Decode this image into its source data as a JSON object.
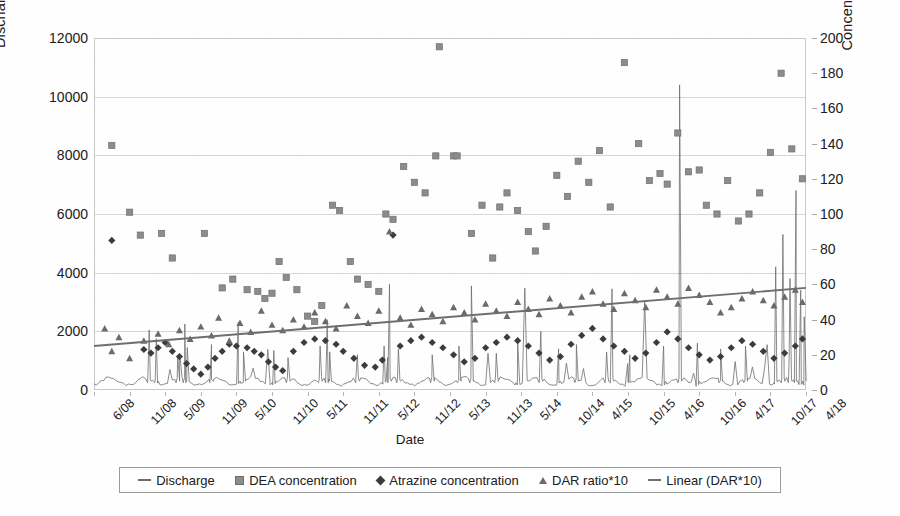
{
  "chart_data": {
    "type": "scatter",
    "title": "",
    "xlabel": "Date",
    "ylabel": "Discharge in L s-1",
    "ylabel_right": "Concentration in ng L-1",
    "ylim": [
      0,
      12000
    ],
    "ylim_right": [
      0,
      200
    ],
    "grid": true,
    "legend_position": "bottom",
    "y_ticks_left": [
      "0",
      "2000",
      "4000",
      "6000",
      "8000",
      "10000",
      "12000"
    ],
    "y_ticks_left_values": [
      0,
      2000,
      4000,
      6000,
      8000,
      10000,
      12000
    ],
    "y_ticks_right": [
      "0",
      "20",
      "40",
      "60",
      "80",
      "100",
      "120",
      "140",
      "160",
      "180",
      "200"
    ],
    "y_ticks_right_values": [
      0,
      20,
      40,
      60,
      80,
      100,
      120,
      140,
      160,
      180,
      200
    ],
    "x_ticks": [
      "6/08",
      "11/08",
      "5/09",
      "11/09",
      "5/10",
      "11/10",
      "5/11",
      "11/11",
      "5/12",
      "11/12",
      "5/13",
      "11/13",
      "5/14",
      "10/14",
      "4/15",
      "10/15",
      "4/16",
      "10/16",
      "4/17",
      "10/17",
      "4/18"
    ],
    "series": [
      {
        "name": "Discharge",
        "type": "line",
        "axis": "left",
        "color": "#6e6e6e",
        "marker": "none"
      },
      {
        "name": "DEA concentration",
        "type": "scatter",
        "axis": "right",
        "color": "#8c8c8c",
        "marker": "square",
        "points": [
          [
            0.5,
            139
          ],
          [
            1.0,
            101
          ],
          [
            1.3,
            88
          ],
          [
            1.9,
            89
          ],
          [
            2.2,
            75
          ],
          [
            3.1,
            89
          ],
          [
            3.6,
            58
          ],
          [
            3.9,
            63
          ],
          [
            4.3,
            57
          ],
          [
            4.6,
            56
          ],
          [
            4.8,
            52
          ],
          [
            5.0,
            55
          ],
          [
            5.2,
            73
          ],
          [
            5.4,
            64
          ],
          [
            5.7,
            57
          ],
          [
            6.0,
            42
          ],
          [
            6.2,
            39
          ],
          [
            6.4,
            48
          ],
          [
            6.7,
            105
          ],
          [
            6.9,
            102
          ],
          [
            7.2,
            73
          ],
          [
            7.4,
            63
          ],
          [
            7.7,
            60
          ],
          [
            8.0,
            56
          ],
          [
            8.2,
            100
          ],
          [
            8.4,
            97
          ],
          [
            8.7,
            127
          ],
          [
            9.0,
            118
          ],
          [
            9.3,
            112
          ],
          [
            9.6,
            133
          ],
          [
            9.7,
            195
          ],
          [
            10.1,
            133
          ],
          [
            10.2,
            133
          ],
          [
            10.6,
            89
          ],
          [
            10.9,
            105
          ],
          [
            11.2,
            75
          ],
          [
            11.4,
            104
          ],
          [
            11.6,
            112
          ],
          [
            11.9,
            102
          ],
          [
            12.2,
            90
          ],
          [
            12.4,
            79
          ],
          [
            12.7,
            93
          ],
          [
            13.0,
            122
          ],
          [
            13.3,
            110
          ],
          [
            13.6,
            130
          ],
          [
            13.9,
            118
          ],
          [
            14.2,
            136
          ],
          [
            14.5,
            104
          ],
          [
            14.9,
            186
          ],
          [
            15.3,
            140
          ],
          [
            15.6,
            119
          ],
          [
            15.9,
            123
          ],
          [
            16.1,
            117
          ],
          [
            16.4,
            146
          ],
          [
            16.7,
            124
          ],
          [
            17.0,
            125
          ],
          [
            17.2,
            105
          ],
          [
            17.5,
            100
          ],
          [
            17.8,
            119
          ],
          [
            18.1,
            96
          ],
          [
            18.4,
            100
          ],
          [
            18.7,
            112
          ],
          [
            19.0,
            135
          ],
          [
            19.3,
            180
          ],
          [
            19.6,
            137
          ],
          [
            19.9,
            120
          ]
        ]
      },
      {
        "name": "Atrazine concentration",
        "type": "scatter",
        "axis": "right",
        "color": "#3c3c3c",
        "marker": "diamond",
        "points": [
          [
            0.5,
            85
          ],
          [
            1.4,
            23
          ],
          [
            1.6,
            21
          ],
          [
            1.8,
            24
          ],
          [
            2.0,
            27
          ],
          [
            2.2,
            22
          ],
          [
            2.4,
            19
          ],
          [
            2.6,
            15
          ],
          [
            2.8,
            12
          ],
          [
            3.0,
            9
          ],
          [
            3.2,
            13
          ],
          [
            3.4,
            18
          ],
          [
            3.6,
            22
          ],
          [
            3.8,
            26
          ],
          [
            4.0,
            25
          ],
          [
            4.3,
            24
          ],
          [
            4.5,
            22
          ],
          [
            4.7,
            20
          ],
          [
            4.9,
            16
          ],
          [
            5.1,
            13
          ],
          [
            5.3,
            11
          ],
          [
            5.6,
            22
          ],
          [
            5.9,
            27
          ],
          [
            6.2,
            29
          ],
          [
            6.5,
            28
          ],
          [
            6.8,
            26
          ],
          [
            7.0,
            22
          ],
          [
            7.3,
            18
          ],
          [
            7.6,
            14
          ],
          [
            7.9,
            13
          ],
          [
            8.1,
            17
          ],
          [
            8.4,
            88
          ],
          [
            8.6,
            25
          ],
          [
            8.9,
            28
          ],
          [
            9.2,
            30
          ],
          [
            9.5,
            27
          ],
          [
            9.8,
            24
          ],
          [
            10.1,
            20
          ],
          [
            10.4,
            16
          ],
          [
            10.7,
            18
          ],
          [
            11.0,
            24
          ],
          [
            11.3,
            27
          ],
          [
            11.6,
            30
          ],
          [
            11.9,
            28
          ],
          [
            12.2,
            25
          ],
          [
            12.5,
            21
          ],
          [
            12.8,
            17
          ],
          [
            13.1,
            19
          ],
          [
            13.4,
            26
          ],
          [
            13.7,
            31
          ],
          [
            14.0,
            35
          ],
          [
            14.3,
            29
          ],
          [
            14.6,
            25
          ],
          [
            14.9,
            22
          ],
          [
            15.2,
            18
          ],
          [
            15.5,
            21
          ],
          [
            15.8,
            27
          ],
          [
            16.1,
            33
          ],
          [
            16.4,
            29
          ],
          [
            16.7,
            24
          ],
          [
            17.0,
            20
          ],
          [
            17.3,
            17
          ],
          [
            17.6,
            19
          ],
          [
            17.9,
            24
          ],
          [
            18.2,
            28
          ],
          [
            18.5,
            26
          ],
          [
            18.8,
            22
          ],
          [
            19.1,
            18
          ],
          [
            19.4,
            21
          ],
          [
            19.7,
            25
          ],
          [
            19.9,
            29
          ]
        ]
      },
      {
        "name": "DAR ratio*10",
        "type": "scatter",
        "axis": "right",
        "color": "#6a6a6a",
        "marker": "triangle",
        "points": [
          [
            0.3,
            35
          ],
          [
            0.5,
            22
          ],
          [
            0.7,
            30
          ],
          [
            1.0,
            18
          ],
          [
            1.4,
            28
          ],
          [
            1.8,
            32
          ],
          [
            2.1,
            26
          ],
          [
            2.4,
            34
          ],
          [
            2.7,
            29
          ],
          [
            3.0,
            36
          ],
          [
            3.3,
            31
          ],
          [
            3.5,
            41
          ],
          [
            3.8,
            28
          ],
          [
            4.1,
            38
          ],
          [
            4.4,
            33
          ],
          [
            4.7,
            45
          ],
          [
            5.0,
            37
          ],
          [
            5.3,
            34
          ],
          [
            5.6,
            40
          ],
          [
            5.9,
            36
          ],
          [
            6.2,
            44
          ],
          [
            6.5,
            39
          ],
          [
            6.8,
            35
          ],
          [
            7.1,
            48
          ],
          [
            7.4,
            42
          ],
          [
            7.7,
            38
          ],
          [
            8.0,
            45
          ],
          [
            8.3,
            90
          ],
          [
            8.6,
            41
          ],
          [
            8.9,
            37
          ],
          [
            9.2,
            46
          ],
          [
            9.5,
            43
          ],
          [
            9.8,
            39
          ],
          [
            10.1,
            47
          ],
          [
            10.4,
            44
          ],
          [
            10.7,
            40
          ],
          [
            11.0,
            49
          ],
          [
            11.3,
            45
          ],
          [
            11.6,
            42
          ],
          [
            11.9,
            50
          ],
          [
            12.2,
            46
          ],
          [
            12.5,
            43
          ],
          [
            12.8,
            52
          ],
          [
            13.1,
            48
          ],
          [
            13.4,
            44
          ],
          [
            13.7,
            53
          ],
          [
            14.0,
            56
          ],
          [
            14.3,
            49
          ],
          [
            14.6,
            46
          ],
          [
            14.9,
            55
          ],
          [
            15.2,
            51
          ],
          [
            15.5,
            47
          ],
          [
            15.8,
            57
          ],
          [
            16.1,
            53
          ],
          [
            16.4,
            49
          ],
          [
            16.7,
            58
          ],
          [
            17.0,
            54
          ],
          [
            17.3,
            50
          ],
          [
            17.6,
            44
          ],
          [
            17.9,
            47
          ],
          [
            18.2,
            52
          ],
          [
            18.5,
            56
          ],
          [
            18.8,
            51
          ],
          [
            19.1,
            48
          ],
          [
            19.4,
            53
          ],
          [
            19.7,
            57
          ],
          [
            19.9,
            50
          ]
        ]
      },
      {
        "name": "Linear (DAR*10)",
        "type": "trendline",
        "axis": "right",
        "color": "#6e6e6e",
        "start": [
          0.0,
          25
        ],
        "end": [
          20.0,
          58
        ]
      }
    ]
  },
  "legend": {
    "items": [
      {
        "label": "Discharge",
        "marker": "line"
      },
      {
        "label": "DEA concentration",
        "marker": "square"
      },
      {
        "label": "Atrazine concentration",
        "marker": "diamond"
      },
      {
        "label": "DAR ratio*10",
        "marker": "triangle"
      },
      {
        "label": "Linear (DAR*10)",
        "marker": "line"
      }
    ]
  },
  "axes": {
    "left_title": "Discharge in L s",
    "left_title_sup": "-1",
    "right_title": "Concentration in ng L",
    "right_title_sup": "-1",
    "x_title": "Date"
  },
  "colors": {
    "dea": "#8c8c8c",
    "atrazine": "#3c3c3c",
    "dar": "#6a6a6a",
    "discharge": "#6e6e6e",
    "trend": "#6e6e6e",
    "grid": "#d6d6d6",
    "frame": "#c9c9c9"
  }
}
